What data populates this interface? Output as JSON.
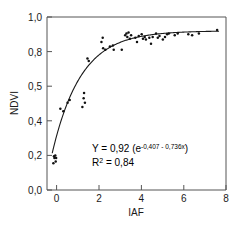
{
  "chart_data": {
    "type": "scatter",
    "title": "",
    "xlabel": "IAF",
    "ylabel": "NDVI",
    "xlim": [
      -0.45,
      8.0
    ],
    "ylim": [
      0.0,
      1.0
    ],
    "xticks": [
      "0",
      "2",
      "4",
      "6",
      "8"
    ],
    "xtick_values": [
      0,
      2,
      4,
      6,
      8
    ],
    "yticks": [
      "0,0",
      "0,2",
      "0,4",
      "0,5",
      "0,8",
      "1,0"
    ],
    "ytick_values": [
      0.0,
      0.2,
      0.4,
      0.6,
      0.8,
      1.0
    ],
    "grid": false,
    "legend": "none",
    "decimal_separator": ",",
    "points": [
      [
        -0.15,
        0.155
      ],
      [
        -0.1,
        0.185
      ],
      [
        -0.06,
        0.2
      ],
      [
        -0.02,
        0.185
      ],
      [
        -0.12,
        0.195
      ],
      [
        -0.04,
        0.165
      ],
      [
        0.18,
        0.47
      ],
      [
        0.32,
        0.455
      ],
      [
        0.52,
        0.505
      ],
      [
        0.62,
        0.52
      ],
      [
        1.22,
        0.48
      ],
      [
        1.28,
        0.53
      ],
      [
        1.3,
        0.56
      ],
      [
        1.34,
        0.505
      ],
      [
        1.46,
        0.76
      ],
      [
        1.52,
        0.745
      ],
      [
        2.12,
        0.855
      ],
      [
        2.18,
        0.88
      ],
      [
        2.2,
        0.82
      ],
      [
        2.3,
        0.81
      ],
      [
        2.52,
        0.83
      ],
      [
        2.66,
        0.835
      ],
      [
        2.7,
        0.81
      ],
      [
        3.08,
        0.81
      ],
      [
        3.24,
        0.895
      ],
      [
        3.3,
        0.905
      ],
      [
        3.34,
        0.885
      ],
      [
        3.4,
        0.91
      ],
      [
        3.46,
        0.875
      ],
      [
        3.52,
        0.895
      ],
      [
        3.72,
        0.88
      ],
      [
        3.8,
        0.855
      ],
      [
        3.88,
        0.89
      ],
      [
        4.02,
        0.9
      ],
      [
        4.08,
        0.875
      ],
      [
        4.16,
        0.885
      ],
      [
        4.22,
        0.87
      ],
      [
        4.38,
        0.88
      ],
      [
        4.46,
        0.845
      ],
      [
        4.54,
        0.885
      ],
      [
        4.7,
        0.905
      ],
      [
        4.78,
        0.88
      ],
      [
        4.86,
        0.89
      ],
      [
        5.02,
        0.87
      ],
      [
        5.12,
        0.885
      ],
      [
        5.22,
        0.9
      ],
      [
        5.3,
        0.905
      ],
      [
        5.58,
        0.895
      ],
      [
        5.72,
        0.905
      ],
      [
        6.22,
        0.9
      ],
      [
        6.4,
        0.895
      ],
      [
        6.72,
        0.905
      ],
      [
        7.58,
        0.925
      ]
    ],
    "fit": {
      "equation_prefix": "Y = 0,92 (e",
      "equation_exponent": "-0,407 - 0,736x",
      "equation_suffix": ")",
      "r2_label": "R",
      "r2_sup": "2",
      "r2_value": " = 0,84",
      "asymptote": 0.92,
      "a": -0.407,
      "b": -0.736,
      "r_squared": 0.84
    },
    "style": {
      "point_color": "#111111",
      "curve_color": "#1a1a1a",
      "axis_color": "#555555",
      "background": "#ffffff"
    }
  }
}
